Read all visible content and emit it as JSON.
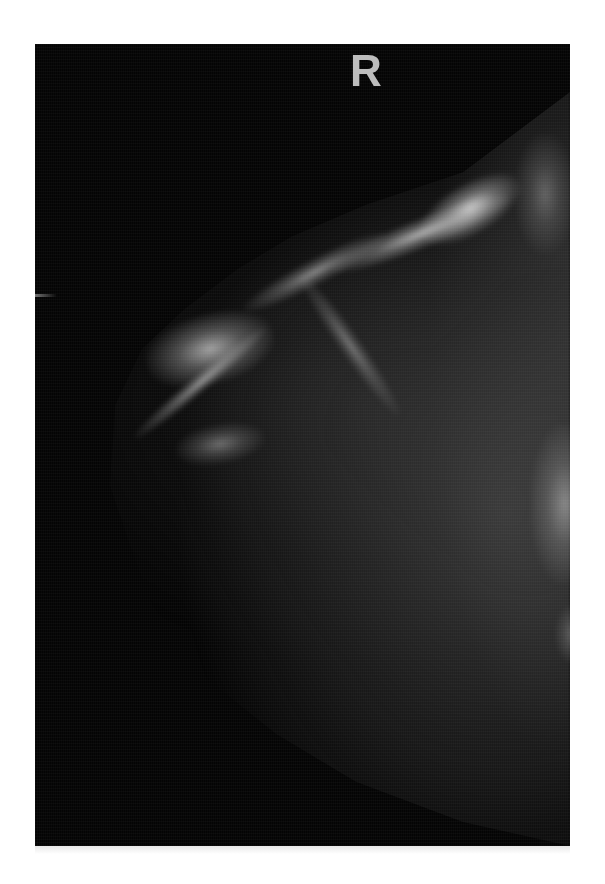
{
  "image": {
    "type": "mammogram",
    "modality": "X-ray mammography (grayscale film)",
    "laterality_marker": "R",
    "background_color": "#ffffff",
    "film_color": "#040404",
    "tissue_highlight_color": "#e6e6e6"
  }
}
